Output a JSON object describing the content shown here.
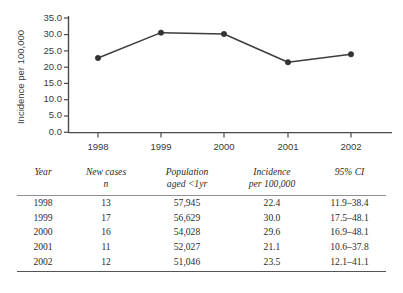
{
  "chart_data": {
    "type": "line",
    "title": "",
    "xlabel": "",
    "ylabel": "Incidence per 100,000",
    "categories": [
      "1998",
      "1999",
      "2000",
      "2001",
      "2002"
    ],
    "values": [
      22.4,
      30.0,
      29.6,
      21.1,
      23.5
    ],
    "series": [
      {
        "name": "Incidence per 100,000",
        "values": [
          22.4,
          30.0,
          29.6,
          21.1,
          23.5
        ]
      }
    ],
    "ylim": [
      0.0,
      35.0
    ],
    "ytick_labels": [
      "0.0",
      "5.0",
      "10.0",
      "15.0",
      "20.0",
      "25.0",
      "30.0",
      "35.0"
    ],
    "ytick_values": [
      0.0,
      5.0,
      10.0,
      15.0,
      20.0,
      25.0,
      30.0,
      35.0
    ],
    "xtick_labels": [
      "1998",
      "1999",
      "2000",
      "2001",
      "2002"
    ],
    "grid": false,
    "legend": "none",
    "marker": "filled-circle",
    "line_color": "#3d3d3d",
    "marker_color": "#333333"
  },
  "table": {
    "headers": [
      {
        "line1": "Year",
        "line2": ""
      },
      {
        "line1": "New cases",
        "line2": "n"
      },
      {
        "line1": "Population",
        "line2": "aged <1yr"
      },
      {
        "line1": "Incidence",
        "line2": "per 100,000"
      },
      {
        "line1": "95% CI",
        "line2": ""
      }
    ],
    "rows": [
      {
        "year": "1998",
        "new_cases": "13",
        "population": "57,945",
        "incidence": "22.4",
        "ci": "11.9–38.4"
      },
      {
        "year": "1999",
        "new_cases": "17",
        "population": "56,629",
        "incidence": "30.0",
        "ci": "17.5–48.1"
      },
      {
        "year": "2000",
        "new_cases": "16",
        "population": "54,028",
        "incidence": "29.6",
        "ci": "16.9–48.1"
      },
      {
        "year": "2001",
        "new_cases": "11",
        "population": "52,027",
        "incidence": "21.1",
        "ci": "10.6–37.8"
      },
      {
        "year": "2002",
        "new_cases": "12",
        "population": "51,046",
        "incidence": "23.5",
        "ci": "12.1–41.1"
      }
    ]
  }
}
